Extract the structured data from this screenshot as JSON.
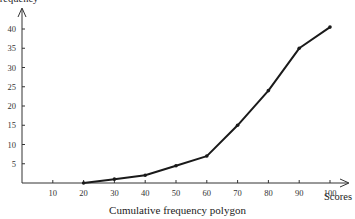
{
  "chart_data": {
    "type": "line",
    "title": "",
    "caption": "Cumulative frequency polygon",
    "xlabel": "Scores",
    "ylabel": "Frequency",
    "x": [
      20,
      30,
      40,
      50,
      60,
      70,
      80,
      90,
      100
    ],
    "series": [
      {
        "name": "Cumulative frequency",
        "values": [
          0,
          1,
          2,
          4.5,
          7,
          15,
          24,
          35,
          40.5
        ]
      }
    ],
    "x_ticks": [
      10,
      20,
      30,
      40,
      50,
      60,
      70,
      80,
      90,
      100
    ],
    "y_ticks": [
      5,
      10,
      15,
      20,
      25,
      30,
      35,
      40
    ],
    "xlim": [
      0,
      105
    ],
    "ylim": [
      0,
      45
    ],
    "grid": false,
    "legend": "none",
    "line_color": "#1a1a1a"
  }
}
